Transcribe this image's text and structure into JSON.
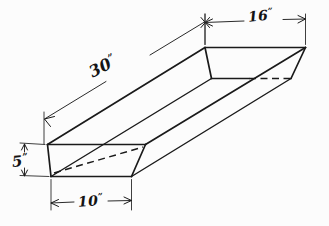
{
  "drawing": {
    "title": "Trough oblique projection with dimensions",
    "background_color": "#fcfcfc",
    "line_color": "#1a1a1a",
    "dimensions": [
      {
        "id": "length",
        "value": "30",
        "unit": "”",
        "label": "30”",
        "orientation": "diagonal",
        "describes": "overall length of trough"
      },
      {
        "id": "top-width",
        "value": "16",
        "unit": "”",
        "label": "16”",
        "orientation": "horizontal-top",
        "describes": "top opening width of trough"
      },
      {
        "id": "depth",
        "value": "5",
        "unit": "”",
        "label": "5”",
        "orientation": "vertical-left",
        "describes": "vertical depth of trough"
      },
      {
        "id": "bottom-width",
        "value": "10",
        "unit": "”",
        "label": "10”",
        "orientation": "horizontal-bottom",
        "describes": "bottom width of trough"
      }
    ]
  },
  "labels": {
    "length_number": "30",
    "length_unit": "”",
    "top_width_number": "16",
    "top_width_unit": "”",
    "depth_number": "5",
    "depth_unit": "”",
    "bottom_width_number": "10",
    "bottom_width_unit": "”"
  }
}
